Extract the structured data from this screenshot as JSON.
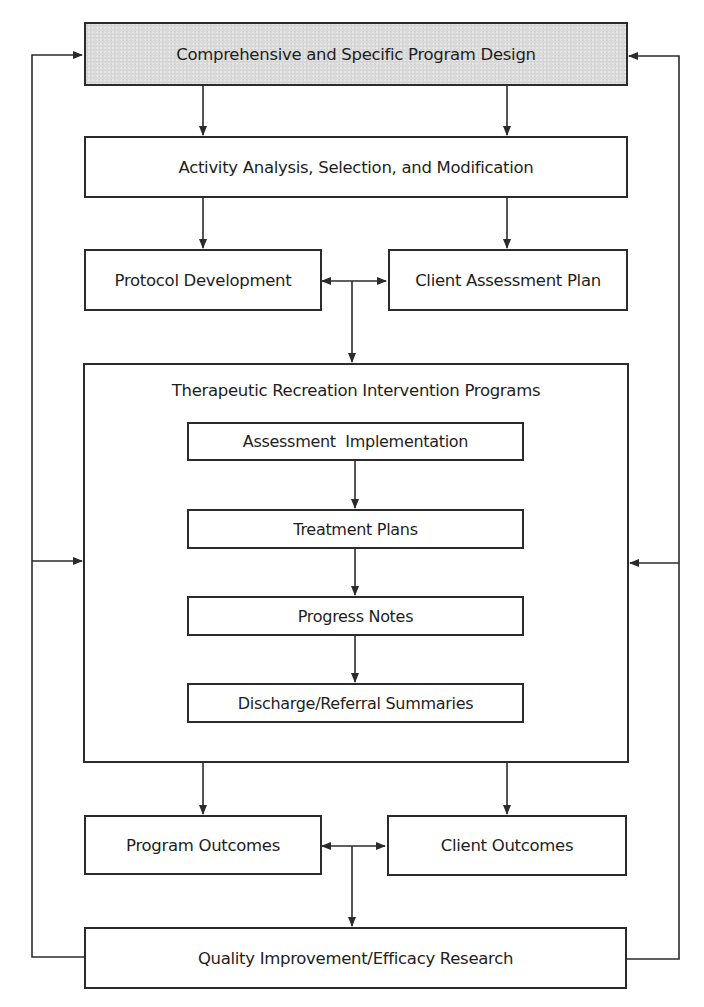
{
  "diagram": {
    "type": "flowchart",
    "nodes": {
      "program_design": {
        "label": "Comprehensive and Specific Program Design",
        "shaded": true
      },
      "activity_analysis": {
        "label": "Activity Analysis, Selection, and Modification"
      },
      "protocol_development": {
        "label": "Protocol Development"
      },
      "client_assessment_plan": {
        "label": "Client Assessment Plan"
      },
      "intervention_programs": {
        "label": "Therapeutic Recreation Intervention Programs",
        "children": {
          "assessment_implementation": {
            "label": "Assessment  Implementation"
          },
          "treatment_plans": {
            "label": "Treatment Plans"
          },
          "progress_notes": {
            "label": "Progress Notes"
          },
          "discharge_summaries": {
            "label": "Discharge/Referral Summaries"
          }
        }
      },
      "program_outcomes": {
        "label": "Program Outcomes"
      },
      "client_outcomes": {
        "label": "Client Outcomes"
      },
      "quality_improvement": {
        "label": "Quality Improvement/Efficacy Research"
      }
    },
    "edges": [
      {
        "from": "Comprehensive and Specific Program Design",
        "to": "Activity Analysis, Selection, and Modification"
      },
      {
        "from": "Activity Analysis, Selection, and Modification",
        "to": "Protocol Development"
      },
      {
        "from": "Activity Analysis, Selection, and Modification",
        "to": "Client Assessment Plan"
      },
      {
        "from": "Protocol Development",
        "to": "Client Assessment Plan",
        "bidirectional": true
      },
      {
        "from": "Protocol Development / Client Assessment Plan",
        "to": "Therapeutic Recreation Intervention Programs"
      },
      {
        "from": "Assessment  Implementation",
        "to": "Treatment Plans"
      },
      {
        "from": "Treatment Plans",
        "to": "Progress Notes"
      },
      {
        "from": "Progress Notes",
        "to": "Discharge/Referral Summaries"
      },
      {
        "from": "Therapeutic Recreation Intervention Programs",
        "to": "Program Outcomes"
      },
      {
        "from": "Therapeutic Recreation Intervention Programs",
        "to": "Client Outcomes"
      },
      {
        "from": "Program Outcomes",
        "to": "Client Outcomes",
        "bidirectional": true
      },
      {
        "from": "Program Outcomes / Client Outcomes",
        "to": "Quality Improvement/Efficacy Research"
      },
      {
        "from": "Quality Improvement/Efficacy Research",
        "to": "Comprehensive and Specific Program Design",
        "side": "left"
      },
      {
        "from": "Quality Improvement/Efficacy Research",
        "to": "Therapeutic Recreation Intervention Programs",
        "side": "left"
      },
      {
        "from": "Quality Improvement/Efficacy Research",
        "to": "Comprehensive and Specific Program Design",
        "side": "right"
      },
      {
        "from": "Quality Improvement/Efficacy Research",
        "to": "Therapeutic Recreation Intervention Programs",
        "side": "right"
      }
    ],
    "colors": {
      "line": "#2b2b2b",
      "shaded_fill": "#d9d9d9",
      "box_fill": "#ffffff"
    }
  }
}
